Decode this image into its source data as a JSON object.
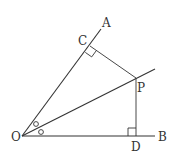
{
  "diagram": {
    "type": "geometry",
    "stroke_color": "#333333",
    "background": "#ffffff",
    "points": {
      "O": {
        "label": "O",
        "x": 22,
        "y": 136
      },
      "A": {
        "label": "A",
        "x": 100,
        "y": 30
      },
      "B": {
        "label": "B",
        "x": 155,
        "y": 136
      },
      "C": {
        "label": "C",
        "x": 90,
        "y": 46
      },
      "P": {
        "label": "P",
        "x": 136,
        "y": 78
      },
      "D": {
        "label": "D",
        "x": 136,
        "y": 136
      }
    },
    "labels": {
      "A": "A",
      "B": "B",
      "C": "C",
      "P": "P",
      "D": "D",
      "O": "O"
    },
    "segments": [
      {
        "from": "O",
        "to": "A",
        "name": "ray-OA"
      },
      {
        "from": "O",
        "to": "B",
        "name": "ray-OB"
      },
      {
        "from": "O",
        "to": "bisector_end",
        "name": "bisector-OP"
      },
      {
        "from": "C",
        "to": "P",
        "name": "segment-CP"
      },
      {
        "from": "P",
        "to": "D",
        "name": "segment-PD"
      }
    ],
    "right_angles": [
      "C",
      "D"
    ],
    "equal_angle_marks": [
      "angle-AOP",
      "angle-POB"
    ]
  }
}
